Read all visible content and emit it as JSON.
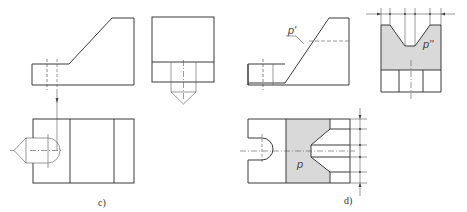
{
  "figure": {
    "panels": [
      {
        "id": "c",
        "caption": "c)",
        "views": [
          "front-view",
          "side-view",
          "top-view"
        ]
      },
      {
        "id": "d",
        "caption": "d)",
        "views": [
          "front-view",
          "side-view",
          "top-view"
        ],
        "labels": {
          "front": "p'",
          "side": "p''",
          "top": "p"
        }
      }
    ],
    "colors": {
      "line": "#3a3a3a",
      "shade": "#d9d9d9",
      "background": "#ffffff"
    }
  }
}
